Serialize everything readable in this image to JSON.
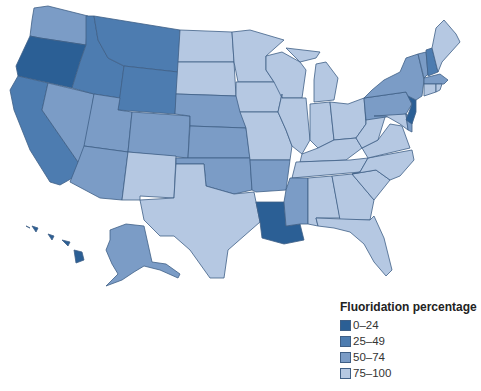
{
  "legend": {
    "title": "Fluoridation percentage",
    "items": [
      {
        "label": "0–24",
        "color": "#2b5f95"
      },
      {
        "label": "25–49",
        "color": "#4d7cb0"
      },
      {
        "label": "50–74",
        "color": "#7b9cc6"
      },
      {
        "label": "75–100",
        "color": "#b5c8e2"
      }
    ]
  },
  "states": {
    "0-24": [
      "Oregon",
      "Louisiana",
      "New Jersey",
      "Hawaii"
    ],
    "25-49": [
      "California",
      "Idaho",
      "Montana",
      "Wyoming",
      "Utah",
      "New Hampshire"
    ],
    "50-74": [
      "Washington",
      "Nevada",
      "Arizona",
      "Colorado",
      "Nebraska",
      "Kansas",
      "Oklahoma",
      "Arkansas",
      "Mississippi",
      "Pennsylvania",
      "New York",
      "Vermont",
      "Massachusetts",
      "Delaware",
      "Alaska"
    ],
    "75-100": [
      "North Dakota",
      "South Dakota",
      "Minnesota",
      "Iowa",
      "Missouri",
      "Wisconsin",
      "Illinois",
      "Michigan",
      "Indiana",
      "Ohio",
      "Kentucky",
      "Tennessee",
      "Alabama",
      "Georgia",
      "Florida",
      "South Carolina",
      "North Carolina",
      "Virginia",
      "West Virginia",
      "Maryland",
      "Maine",
      "Connecticut",
      "Rhode Island",
      "New Mexico",
      "Texas"
    ]
  }
}
